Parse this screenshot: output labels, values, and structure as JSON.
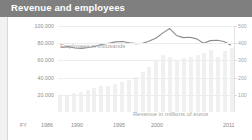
{
  "header": {
    "title": "Revenue and employees"
  },
  "chart_data": {
    "type": "bar",
    "title": "Revenue and employees",
    "xlabel": "FY",
    "ylabel": "Employees in thousands",
    "y2label": "Revenue in millions of euros",
    "grid": true,
    "legend_position": "inline-annotations",
    "annotations": [
      "Employees in thousands",
      "Revenue in millions of euros"
    ],
    "x_axis_prefix": "FY",
    "categories": [
      "1986",
      "1987",
      "1988",
      "1989",
      "1990",
      "1991",
      "1992",
      "1993",
      "1994",
      "1995",
      "1996",
      "1997",
      "1998",
      "1999",
      "2000",
      "2001",
      "2002",
      "2003",
      "2004",
      "2005",
      "2006",
      "2007",
      "2008",
      "2009",
      "2010",
      "2011"
    ],
    "xtick_labels": [
      "FY",
      "1986",
      "1990",
      "1995",
      "2000",
      "2011"
    ],
    "ylim": [
      0,
      100000
    ],
    "ytick_labels": [
      "100.000",
      "80.000",
      "60.000",
      "40.000",
      "20.000"
    ],
    "ytick_values": [
      100000,
      80000,
      60000,
      40000,
      20000
    ],
    "y2lim": [
      0,
      500
    ],
    "y2tick_labels": [
      "500",
      "400",
      "300",
      "200",
      "100"
    ],
    "y2tick_values": [
      500,
      400,
      300,
      200,
      100
    ],
    "series": [
      {
        "name": "Revenue in millions of euros",
        "type": "bar",
        "axis": "right",
        "color": "#f0f0f0",
        "values": [
          95,
          100,
          108,
          118,
          128,
          140,
          152,
          150,
          160,
          172,
          186,
          205,
          230,
          262,
          300,
          330,
          318,
          300,
          312,
          318,
          330,
          345,
          360,
          320,
          352,
          372
        ]
      },
      {
        "name": "Employees in thousands",
        "type": "line",
        "axis": "left",
        "color": "#8c8c8c",
        "values": [
          75000,
          76000,
          74500,
          74000,
          75000,
          76500,
          78500,
          80000,
          81500,
          82000,
          80500,
          79500,
          80000,
          82500,
          86000,
          92000,
          97000,
          89000,
          86500,
          87000,
          85000,
          80000,
          83000,
          83500,
          82000,
          78000
        ]
      }
    ]
  }
}
